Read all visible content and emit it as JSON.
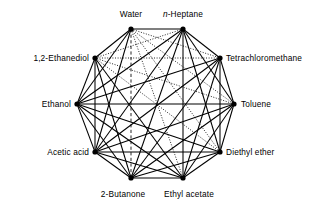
{
  "figure": {
    "type": "complete-graph",
    "node_count": 10,
    "edge_count": 45,
    "background_color": "#ffffff",
    "line_color": "#000000",
    "node_color": "#000000"
  },
  "nodes": [
    {
      "id": "water",
      "label": "Water",
      "label_prefix": "",
      "x": 131,
      "y": 29,
      "label_x": 131,
      "label_y": 14,
      "anchor": "mid",
      "italic_prefix": false
    },
    {
      "id": "n-heptane",
      "label": "-Heptane",
      "label_prefix": "n",
      "x": 183,
      "y": 29,
      "label_x": 183,
      "label_y": 14,
      "anchor": "mid",
      "italic_prefix": true
    },
    {
      "id": "tetrachloromethane",
      "label": "Tetrachloromethane",
      "label_prefix": "",
      "x": 220,
      "y": 58,
      "label_x": 226,
      "label_y": 58,
      "anchor": "start",
      "italic_prefix": false
    },
    {
      "id": "toluene",
      "label": "Toluene",
      "label_prefix": "",
      "x": 234,
      "y": 104,
      "label_x": 241,
      "label_y": 104,
      "anchor": "start",
      "italic_prefix": false
    },
    {
      "id": "diethyl-ether",
      "label": "Diethyl ether",
      "label_prefix": "",
      "x": 220,
      "y": 152,
      "label_x": 226,
      "label_y": 152,
      "anchor": "start",
      "italic_prefix": false
    },
    {
      "id": "ethyl-acetate",
      "label": "Ethyl acetate",
      "label_prefix": "",
      "x": 183,
      "y": 178,
      "label_x": 189,
      "label_y": 194,
      "anchor": "mid",
      "italic_prefix": false
    },
    {
      "id": "2-butanone",
      "label": "2-Butanone",
      "label_prefix": "",
      "x": 131,
      "y": 178,
      "label_x": 123,
      "label_y": 194,
      "anchor": "mid",
      "italic_prefix": false
    },
    {
      "id": "acetic-acid",
      "label": "Acetic acid",
      "label_prefix": "",
      "x": 95,
      "y": 152,
      "label_x": 89,
      "label_y": 152,
      "anchor": "end",
      "italic_prefix": false
    },
    {
      "id": "ethanol",
      "label": "Ethanol",
      "label_prefix": "",
      "x": 77,
      "y": 104,
      "label_x": 71,
      "label_y": 104,
      "anchor": "end",
      "italic_prefix": false
    },
    {
      "id": "1,2-ethanediol",
      "label": "1,2-Ethanediol",
      "label_prefix": "",
      "x": 95,
      "y": 58,
      "label_x": 89,
      "label_y": 58,
      "anchor": "end",
      "italic_prefix": false
    }
  ],
  "edges": [
    {
      "from": "water",
      "to": "n-heptane",
      "style": "solid"
    },
    {
      "from": "water",
      "to": "tetrachloromethane",
      "style": "dotted"
    },
    {
      "from": "water",
      "to": "toluene",
      "style": "dotted"
    },
    {
      "from": "water",
      "to": "diethyl-ether",
      "style": "dotted"
    },
    {
      "from": "water",
      "to": "ethyl-acetate",
      "style": "dotted"
    },
    {
      "from": "water",
      "to": "2-butanone",
      "style": "dashed"
    },
    {
      "from": "water",
      "to": "acetic-acid",
      "style": "solid"
    },
    {
      "from": "water",
      "to": "ethanol",
      "style": "solid"
    },
    {
      "from": "water",
      "to": "1,2-ethanediol",
      "style": "solid"
    },
    {
      "from": "n-heptane",
      "to": "tetrachloromethane",
      "style": "solid"
    },
    {
      "from": "n-heptane",
      "to": "toluene",
      "style": "solid"
    },
    {
      "from": "n-heptane",
      "to": "diethyl-ether",
      "style": "solid"
    },
    {
      "from": "n-heptane",
      "to": "ethyl-acetate",
      "style": "solid"
    },
    {
      "from": "n-heptane",
      "to": "2-butanone",
      "style": "solid"
    },
    {
      "from": "n-heptane",
      "to": "acetic-acid",
      "style": "solid"
    },
    {
      "from": "n-heptane",
      "to": "ethanol",
      "style": "solid"
    },
    {
      "from": "n-heptane",
      "to": "1,2-ethanediol",
      "style": "dotted"
    },
    {
      "from": "tetrachloromethane",
      "to": "toluene",
      "style": "solid"
    },
    {
      "from": "tetrachloromethane",
      "to": "diethyl-ether",
      "style": "solid"
    },
    {
      "from": "tetrachloromethane",
      "to": "ethyl-acetate",
      "style": "solid"
    },
    {
      "from": "tetrachloromethane",
      "to": "2-butanone",
      "style": "solid"
    },
    {
      "from": "tetrachloromethane",
      "to": "acetic-acid",
      "style": "solid"
    },
    {
      "from": "tetrachloromethane",
      "to": "ethanol",
      "style": "solid"
    },
    {
      "from": "tetrachloromethane",
      "to": "1,2-ethanediol",
      "style": "dotted"
    },
    {
      "from": "toluene",
      "to": "diethyl-ether",
      "style": "solid"
    },
    {
      "from": "toluene",
      "to": "ethyl-acetate",
      "style": "solid"
    },
    {
      "from": "toluene",
      "to": "2-butanone",
      "style": "solid"
    },
    {
      "from": "toluene",
      "to": "acetic-acid",
      "style": "solid"
    },
    {
      "from": "toluene",
      "to": "ethanol",
      "style": "solid"
    },
    {
      "from": "toluene",
      "to": "1,2-ethanediol",
      "style": "dotted"
    },
    {
      "from": "diethyl-ether",
      "to": "ethyl-acetate",
      "style": "solid"
    },
    {
      "from": "diethyl-ether",
      "to": "2-butanone",
      "style": "solid"
    },
    {
      "from": "diethyl-ether",
      "to": "acetic-acid",
      "style": "solid"
    },
    {
      "from": "diethyl-ether",
      "to": "ethanol",
      "style": "solid"
    },
    {
      "from": "diethyl-ether",
      "to": "1,2-ethanediol",
      "style": "dotted"
    },
    {
      "from": "ethyl-acetate",
      "to": "2-butanone",
      "style": "solid"
    },
    {
      "from": "ethyl-acetate",
      "to": "acetic-acid",
      "style": "solid"
    },
    {
      "from": "ethyl-acetate",
      "to": "ethanol",
      "style": "solid"
    },
    {
      "from": "ethyl-acetate",
      "to": "1,2-ethanediol",
      "style": "solid"
    },
    {
      "from": "2-butanone",
      "to": "acetic-acid",
      "style": "solid"
    },
    {
      "from": "2-butanone",
      "to": "ethanol",
      "style": "solid"
    },
    {
      "from": "2-butanone",
      "to": "1,2-ethanediol",
      "style": "solid"
    },
    {
      "from": "acetic-acid",
      "to": "ethanol",
      "style": "solid"
    },
    {
      "from": "acetic-acid",
      "to": "1,2-ethanediol",
      "style": "solid"
    },
    {
      "from": "ethanol",
      "to": "1,2-ethanediol",
      "style": "solid"
    }
  ]
}
